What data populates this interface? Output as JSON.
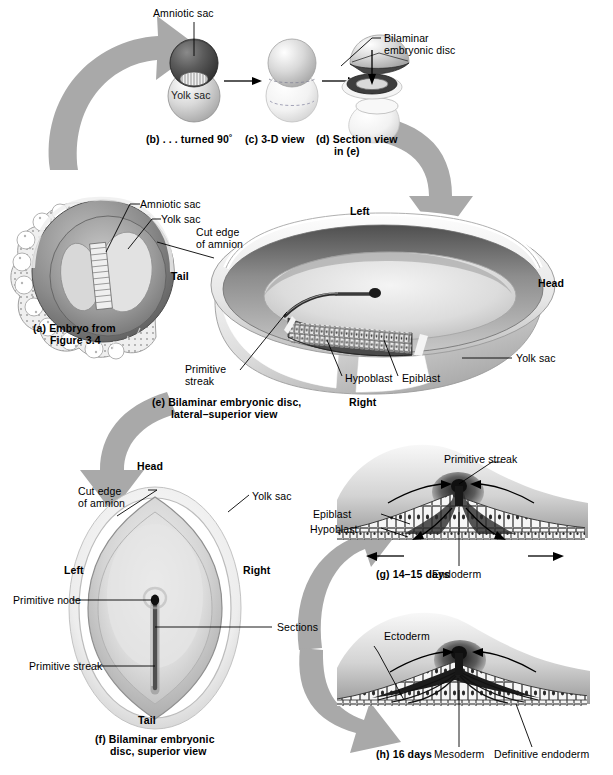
{
  "figure": {
    "colors": {
      "gray_arrow": "#a9a9a9",
      "dark_tissue": "#4a4a4a",
      "mid_tissue": "#8e8e8e",
      "light_tissue": "#d8d8d8",
      "line": "#000000",
      "background": "#ffffff"
    }
  },
  "panel_b": {
    "caption": "(b) . . . turned 90˚",
    "labels": {
      "amniotic_sac": "Amniotic sac",
      "yolk_sac": "Yolk sac"
    }
  },
  "panel_c": {
    "caption": "(c) 3-D view"
  },
  "panel_d": {
    "caption_line1": "(d) Section view",
    "caption_line2": "in (e)",
    "labels": {
      "bilaminar_line1": "Bilaminar",
      "bilaminar_line2": "embryonic disc"
    }
  },
  "panel_a": {
    "caption_line1": "(a) Embryo from",
    "caption_line2": "Figure 3.4",
    "labels": {
      "amniotic_sac": "Amniotic sac",
      "yolk_sac": "Yolk sac"
    }
  },
  "panel_e": {
    "caption_line1": "(e) Bilaminar embryonic disc,",
    "caption_line2": "lateral–superior view",
    "labels": {
      "left": "Left",
      "right": "Right",
      "head": "Head",
      "tail": "Tail",
      "cut_edge_line1": "Cut edge",
      "cut_edge_line2": "of amnion",
      "primitive_line1": "Primitive",
      "primitive_line2": "streak",
      "hypoblast": "Hypoblast",
      "epiblast": "Epiblast",
      "yolk_sac": "Yolk sac"
    }
  },
  "panel_f": {
    "caption_line1": "(f) Bilaminar embryonic",
    "caption_line2": "disc, superior view",
    "labels": {
      "head": "Head",
      "tail": "Tail",
      "left": "Left",
      "right": "Right",
      "cut_edge_line1": "Cut edge",
      "cut_edge_line2": "of amnion",
      "yolk_sac": "Yolk sac",
      "primitive_node": "Primitive node",
      "sections": "Sections",
      "primitive_streak": "Primitive streak"
    }
  },
  "panel_g": {
    "caption": "(g) 14–15 days",
    "labels": {
      "primitive_streak": "Primitive streak",
      "epiblast": "Epiblast",
      "hypoblast": "Hypoblast",
      "endoderm": "Endoderm"
    }
  },
  "panel_h": {
    "caption": "(h) 16 days",
    "labels": {
      "ectoderm": "Ectoderm",
      "mesoderm": "Mesoderm",
      "definitive_endoderm": "Definitive endoderm"
    }
  }
}
